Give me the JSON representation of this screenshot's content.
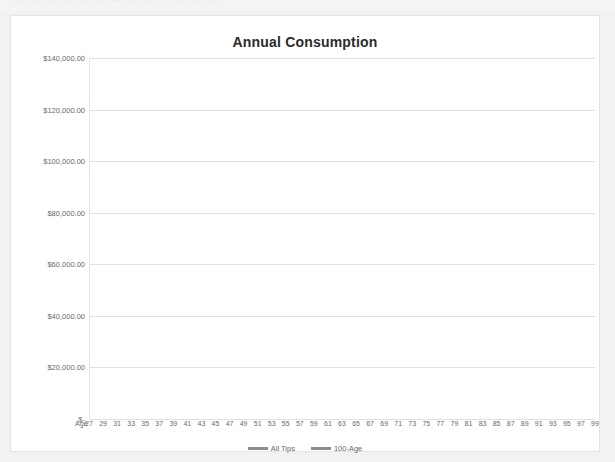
{
  "page": {
    "top_partial_text": "· ··· ·· ···· ·· ··· ···· ·· ···· ··· ·· ···· ··· ····"
  },
  "chart_data": {
    "type": "line",
    "title": "Annual Consumption",
    "xlabel": "Age",
    "ylabel": "",
    "grid": true,
    "legend_position": "bottom",
    "xlim": [
      27,
      99
    ],
    "ylim": [
      0,
      140000
    ],
    "ytick_labels": [
      "$140,000.00",
      "$120,000.00",
      "$100,000.00",
      "$80,000.00",
      "$60,000.00",
      "$40,000.00",
      "$20,000.00",
      "$-"
    ],
    "ytick_values": [
      140000,
      120000,
      100000,
      80000,
      60000,
      40000,
      20000,
      0
    ],
    "x_axis_prefix": "Age",
    "xtick_labels": [
      "27",
      "29",
      "31",
      "33",
      "35",
      "37",
      "39",
      "41",
      "43",
      "45",
      "47",
      "49",
      "51",
      "53",
      "55",
      "57",
      "59",
      "61",
      "63",
      "65",
      "67",
      "69",
      "71",
      "73",
      "75",
      "77",
      "79",
      "81",
      "83",
      "85",
      "87",
      "89",
      "91",
      "93",
      "95",
      "97",
      "99"
    ],
    "x": [
      27,
      29,
      31,
      33,
      35,
      37,
      39,
      41,
      43,
      45,
      47,
      49,
      51,
      53,
      55,
      57,
      59,
      61,
      63,
      65,
      67,
      69,
      71,
      73,
      75,
      77,
      79,
      81,
      83,
      85,
      87,
      89,
      91,
      93,
      95,
      97,
      99
    ],
    "series": [
      {
        "name": "All Tips",
        "color": "#8c8c8c",
        "values": [
          22000,
          22000,
          22000,
          22000,
          22000,
          22000,
          22000,
          22000,
          22000,
          22000,
          22000,
          22000,
          22000,
          22000,
          22200,
          24500,
          27500,
          30800,
          34200,
          37800,
          41800,
          42500,
          44500,
          47000,
          49500,
          52500,
          55500,
          58500,
          62000,
          66000,
          70500,
          76000,
          82000,
          89500,
          98000,
          106500,
          115500
        ]
      },
      {
        "name": "100-Age",
        "color": "#8c8c8c",
        "values": [
          31600,
          31600,
          31600,
          31600,
          31600,
          31600,
          31600,
          31600,
          31600,
          31600,
          31600,
          31600,
          31600,
          31600,
          31600,
          31600,
          31600,
          31600,
          31500,
          31500,
          31500,
          31500,
          31500,
          31500,
          31500,
          31400,
          31400,
          31400,
          31400,
          31400,
          31400,
          31300,
          31300,
          31300,
          31300,
          31300,
          31200
        ]
      }
    ]
  },
  "colors": {
    "series_line": "#8c8c8c",
    "gridline": "#e0e0e0",
    "axis_text": "#6a6a6a",
    "title_text": "#2b2b2b",
    "frame_border": "#e3e3e3",
    "page_background": "#f2f2f2",
    "plot_background": "#ffffff"
  }
}
